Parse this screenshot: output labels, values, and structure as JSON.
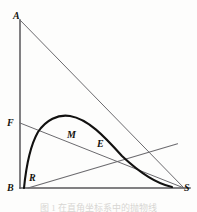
{
  "figure": {
    "kind": "geometry-diagram",
    "caption": "图 1   在直角坐标系中的抛物线",
    "colors": {
      "background": "#fdfdfc",
      "axis": "#57565a",
      "thin_line": "#6b6a6e",
      "curve": "#121110",
      "label": "#15140f"
    },
    "points": [
      {
        "id": "A",
        "label": "A",
        "x": 20,
        "y": 20,
        "label_x": 13,
        "label_y": 11
      },
      {
        "id": "F",
        "label": "F",
        "x": 20,
        "y": 123,
        "label_x": 7,
        "label_y": 118
      },
      {
        "id": "B",
        "label": "B",
        "x": 20,
        "y": 188,
        "label_x": 7,
        "label_y": 183
      },
      {
        "id": "R",
        "label": "R",
        "x": 28,
        "y": 188,
        "label_x": 29,
        "label_y": 173
      },
      {
        "id": "M",
        "label": "M",
        "x": 72,
        "y": 143,
        "label_x": 67,
        "label_y": 130
      },
      {
        "id": "E",
        "label": "E",
        "x": 104,
        "y": 152,
        "label_x": 97,
        "label_y": 139
      },
      {
        "id": "S",
        "label": "S",
        "x": 182,
        "y": 188,
        "label_x": 184,
        "label_y": 183
      }
    ],
    "segments": [
      {
        "id": "axis-vertical-AB",
        "from": "A",
        "to": "B",
        "weight": "axis"
      },
      {
        "id": "axis-horizontal-BS",
        "from": "B",
        "to": "S",
        "weight": "axis"
      },
      {
        "id": "line-AS",
        "from": "A",
        "to": "S",
        "weight": "thin"
      },
      {
        "id": "line-FS",
        "from": "F",
        "to": "S",
        "weight": "thin"
      },
      {
        "id": "line-RS",
        "from": "R",
        "to": "S",
        "weight": "thin"
      }
    ],
    "curve": {
      "id": "parabolic-arc",
      "start": {
        "x": 24,
        "y": 188
      },
      "apex": {
        "x": 70,
        "y": 116
      },
      "end": {
        "x": 172,
        "y": 187
      },
      "path": "M 24 188 C 26 168 30 146 38 132 C 46 120 58 114 70 116 C 88 119 104 136 122 156 C 140 173 158 184 172 187"
    }
  }
}
